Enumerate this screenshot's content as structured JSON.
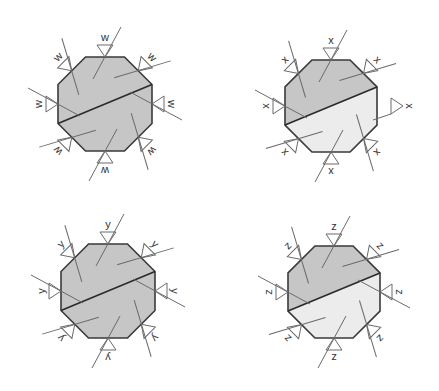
{
  "colors": {
    "dark_fill": "#c6c6c6",
    "light_fill": "#ececec",
    "outline": "#3a3a3a",
    "symbol_stroke": "#6a6a6a"
  },
  "panels": [
    {
      "id": "w",
      "label": "w",
      "cx": 105,
      "cy": 104,
      "r": 47,
      "lower_fill": "dark",
      "detached_right": false
    },
    {
      "id": "x",
      "label": "x",
      "cx": 331,
      "cy": 106,
      "r": 46,
      "lower_fill": "light",
      "detached_right": true
    },
    {
      "id": "y",
      "label": "y",
      "cx": 108,
      "cy": 291,
      "r": 47,
      "lower_fill": "dark",
      "detached_right": false
    },
    {
      "id": "z",
      "label": "z",
      "cx": 334,
      "cy": 292,
      "r": 46,
      "lower_fill": "light",
      "detached_right": false
    }
  ]
}
